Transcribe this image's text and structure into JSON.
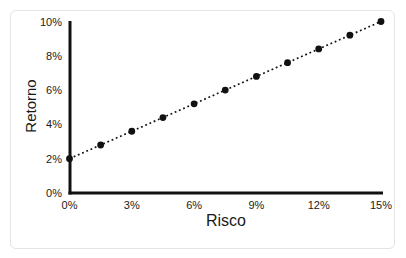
{
  "chart_data": {
    "type": "scatter",
    "title": "",
    "xlabel": "Risco",
    "ylabel": "Retorno",
    "x": [
      0,
      1.5,
      3,
      4.5,
      6,
      7.5,
      9,
      10.5,
      12,
      13.5,
      15
    ],
    "y": [
      2,
      2.8,
      3.6,
      4.4,
      5.2,
      6,
      6.8,
      7.6,
      8.4,
      9.2,
      10
    ],
    "xlim": [
      0,
      15
    ],
    "ylim": [
      0,
      10
    ],
    "x_ticks": [
      0,
      3,
      6,
      9,
      12,
      15
    ],
    "x_tick_labels": [
      "0%",
      "3%",
      "6%",
      "9%",
      "12%",
      "15%"
    ],
    "y_ticks": [
      0,
      2,
      4,
      6,
      8,
      10
    ],
    "y_tick_labels": [
      "0%",
      "2%",
      "4%",
      "6%",
      "8%",
      "10%"
    ],
    "line_style": "dotted",
    "marker": "filled-circle",
    "grid": false,
    "legend": null,
    "colors": {
      "axis": "#111111",
      "line": "#111111",
      "marker": "#111111",
      "tick_text": "#1a1a1a",
      "frame_border": "#e4e4e4",
      "background": "#ffffff"
    }
  }
}
